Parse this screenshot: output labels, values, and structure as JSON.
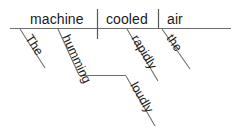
{
  "diagram": {
    "type": "reed-kellogg-sentence-diagram",
    "sentence": "The humming machine cooled the air rapidly loudly",
    "baseline": {
      "subject": "machine",
      "verb": "cooled",
      "object": "air"
    },
    "words": {
      "subject": "machine",
      "verb": "cooled",
      "object": "air",
      "subject_article": "The",
      "subject_adjective": "humming",
      "participle_adverb": "loudly",
      "verb_adverb": "rapidly",
      "object_article": "the"
    },
    "colors": {
      "line": "#6f6f6f",
      "line_dark": "#575757",
      "text": "#1a1a1a",
      "background": "#ffffff"
    }
  }
}
